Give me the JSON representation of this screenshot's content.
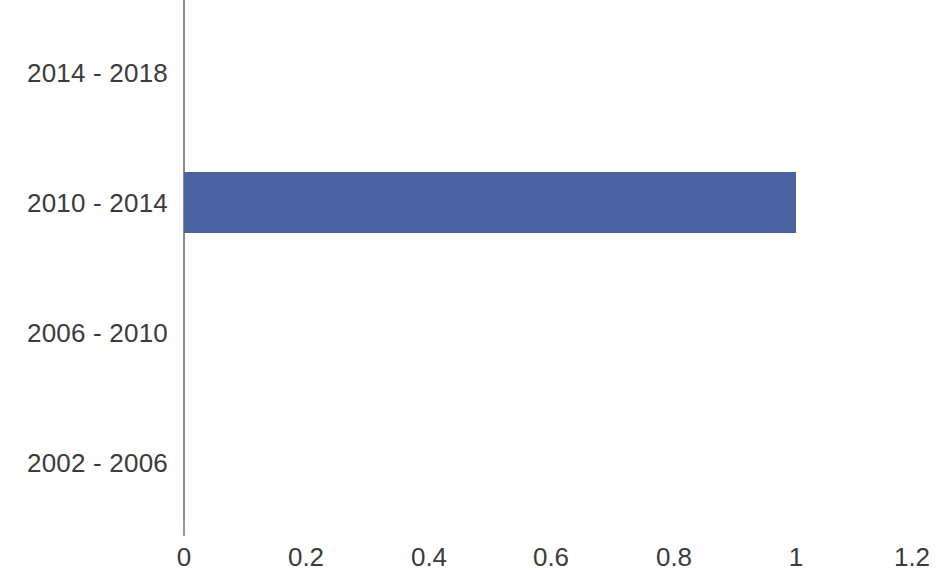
{
  "chart_data": {
    "type": "bar",
    "orientation": "horizontal",
    "title": "",
    "subtitle": "",
    "xlabel": "",
    "ylabel": "",
    "categories": [
      "2014 - 2018",
      "2010 - 2014",
      "2006 - 2010",
      "2002 - 2006"
    ],
    "values": [
      0,
      1,
      0,
      0
    ],
    "series": [
      {
        "name": "",
        "values": [
          0,
          1,
          0,
          0
        ]
      }
    ],
    "xlim": [
      0,
      1.2
    ],
    "xticks": [
      0,
      0.2,
      0.4,
      0.6,
      0.8,
      1,
      1.2
    ],
    "xtick_labels": [
      "0",
      "0.2",
      "0.4",
      "0.6",
      "0.8",
      "1",
      "1.2"
    ],
    "grid": false,
    "legend": false,
    "legend_position": "none",
    "bar_color": "#4a62a0",
    "axis_color": "#8c8c8c",
    "text_color": "#3b3b3b",
    "background_color": "#ffffff",
    "annotations": []
  },
  "axis": {
    "tick_0": "0",
    "tick_1": "0.2",
    "tick_2": "0.4",
    "tick_3": "0.6",
    "tick_4": "0.8",
    "tick_5": "1",
    "tick_6": "1.2"
  },
  "categories": {
    "cat_0": "2014 - 2018",
    "cat_1": "2010 - 2014",
    "cat_2": "2006 - 2010",
    "cat_3": "2002 - 2006"
  }
}
